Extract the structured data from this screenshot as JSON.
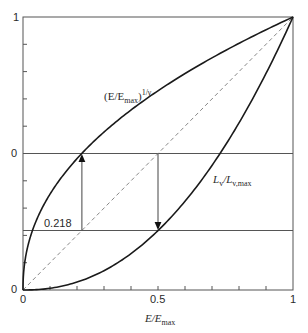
{
  "chart_data": {
    "type": "line",
    "title": "",
    "xlabel": "E/E_max",
    "ylabel": "",
    "xlim": [
      0,
      1
    ],
    "ylim": [
      0,
      1
    ],
    "grid": false,
    "x_ticks": [
      0,
      0.1,
      0.2,
      0.3,
      0.4,
      0.5,
      0.6,
      0.7,
      0.8,
      0.9,
      1
    ],
    "x_tick_labels": [
      "0",
      "0.5",
      "1"
    ],
    "y_tick_labels": [
      "1",
      "0",
      "0"
    ],
    "series": [
      {
        "name": "(E/E_max)^(1/γ)",
        "style": "solid",
        "x": [
          0,
          0.01,
          0.05,
          0.1,
          0.218,
          0.3,
          0.4,
          0.5,
          0.6,
          0.7,
          0.8,
          0.9,
          1.0
        ],
        "y": [
          0,
          0.123,
          0.256,
          0.351,
          0.5,
          0.579,
          0.659,
          0.73,
          0.793,
          0.85,
          0.903,
          0.953,
          1.0
        ]
      },
      {
        "name": "L_v/L_v,max",
        "style": "solid",
        "x": [
          0,
          0.1,
          0.2,
          0.3,
          0.4,
          0.5,
          0.6,
          0.7,
          0.8,
          0.9,
          1.0
        ],
        "y": [
          0,
          0.006,
          0.029,
          0.071,
          0.133,
          0.218,
          0.325,
          0.456,
          0.612,
          0.793,
          1.0
        ]
      },
      {
        "name": "identity",
        "style": "dashed",
        "x": [
          0,
          1
        ],
        "y": [
          0,
          1
        ]
      }
    ],
    "reference_lines": [
      {
        "orientation": "horizontal",
        "y": 0.5,
        "label": "0"
      },
      {
        "orientation": "horizontal",
        "y": 0.218,
        "label": "0.218"
      }
    ],
    "annotations": [
      {
        "type": "arrow",
        "direction": "up",
        "x": 0.218,
        "from_y": 0.218,
        "to_y": 0.5
      },
      {
        "type": "arrow",
        "direction": "down",
        "x": 0.5,
        "from_y": 0.5,
        "to_y": 0.218
      },
      {
        "type": "text",
        "text": "(E/E_max)^(1/γ)",
        "near": [
          0.4,
          0.72
        ]
      },
      {
        "type": "text",
        "text": "L_v/L_v,max",
        "near": [
          0.82,
          0.41
        ]
      },
      {
        "type": "text",
        "text": "0.218",
        "near": [
          0.1,
          0.25
        ]
      }
    ],
    "gamma": 2.2
  },
  "labels": {
    "y_top": "1",
    "y_mid": "0",
    "y_bottom": "0",
    "x_left": "0",
    "x_mid": "0.5",
    "x_right": "1",
    "value_0218": "0.218",
    "xlabel_main": "E/E",
    "xlabel_sub": "max",
    "upper_curve_open": "(E/E",
    "upper_curve_sub": "max",
    "upper_curve_close": ")",
    "upper_curve_exp": "1/γ",
    "lower_curve_main": "L",
    "lower_curve_sub1": "v",
    "lower_curve_slash": "/L",
    "lower_curve_sub2": "v,max"
  },
  "colors": {
    "curve": "#1a1a1a",
    "frame": "#555555",
    "dashed": "#888888",
    "text": "#2a2a2a"
  }
}
